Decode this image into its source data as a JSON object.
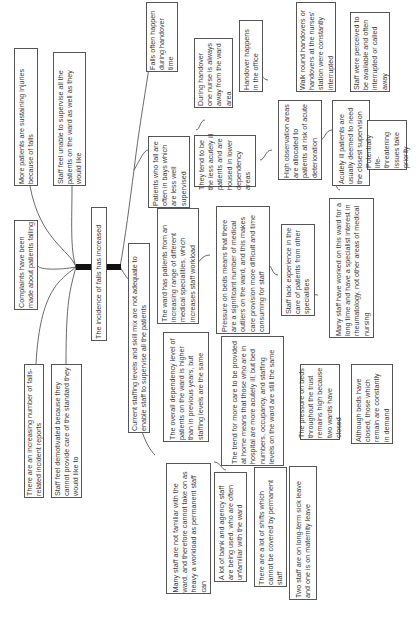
{
  "diagram": {
    "type": "fishbone / cause map (rotated 90°)",
    "root": "The incidence of falls has increased",
    "effects": [
      "More patients are sustaining injuries because of falls",
      "Staff feel unable to supervise all the patients on the ward as well as they would like",
      "Complaints have been made about patients falling",
      "There are an increasing number of falls-related incident reports",
      "Staff feel demotivated because they cannot provide care of the standard they would like to"
    ],
    "causes": {
      "staffing": "Current staffing levels and skill mix are not adequate to enable staff to supervise all the patients",
      "falls_handover": "Falls often happen during handover time",
      "handover_nurse_away": "During handover one nurse is always away from the ward area",
      "handover_office": "Handover happens in the office",
      "walk_round": "Walk round handovers or handovers at the nurses' station were constantly interrupted",
      "perceived_available": "Staff were perceived to be available and often interrupted or called away",
      "bays": "Patients who fall are often in bays which are less well supervised",
      "less_acutely_ill": "They tend to be the less acutely ill patients and are housed in lower dependency areas",
      "high_obs": "High observation areas are allocated to patients at risk of acute deterioration",
      "acutely_ill": "Acutely ill patients are usually deemed to need the closest supervision",
      "life_threatening": "Potentially life-threatening issues take priority",
      "specialities": "The ward has patients from an increasing range of different medical specialities, which increases staff workload",
      "pressure_outliers": "Pressure on beds means that there are a significant number of medical outliers on the ward, and this makes care provision more difficult and time consuming for staff",
      "lack_experience": "Staff lack experience in the care of patients from other specialities",
      "rheumatology": "Many staff have worked on this ward for a long time and have a specialist interest in rheumatology, not other areas of medical nursing",
      "dependency": "The overall dependency level of patients on the ward is higher than in previous years, but staffing levels are the same",
      "care_at_home": "The trend for more care to be provided at home means that those who are in hospital are more acutely ill, but bed numbers, occupancy, and staffing levels on the ward are still the same",
      "pressure_trust": "The pressure on beds throughout the trust remains high because two wards have closed",
      "beds_closed": "Although beds have closed, those which remain are constantly in demand",
      "not_familiar": "Many staff are not familiar with the ward, and therefore cannot take on as heavy a workload as permanent staff can",
      "bank_agency": "A lot of bank and agency staff are being used, who are often unfamiliar with the ward",
      "shifts": "There are a lot of shifts which cannot be covered by permanent staff",
      "sick_leave": "Two staff are on long-term sick leave and one is on maternity leave"
    }
  }
}
